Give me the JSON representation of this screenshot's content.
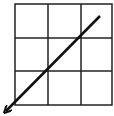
{
  "diagram": {
    "type": "grid-with-arrow",
    "grid": {
      "rows": 3,
      "cols": 3,
      "x": 15,
      "y": 4,
      "width": 97,
      "height": 101,
      "line_color": "#222222",
      "line_width": 1.5
    },
    "arrow": {
      "from": [
        100,
        16
      ],
      "to": [
        5,
        112
      ],
      "direction": "down-left",
      "color": "#111111",
      "width": 2.5
    },
    "background": "#ffffff"
  }
}
